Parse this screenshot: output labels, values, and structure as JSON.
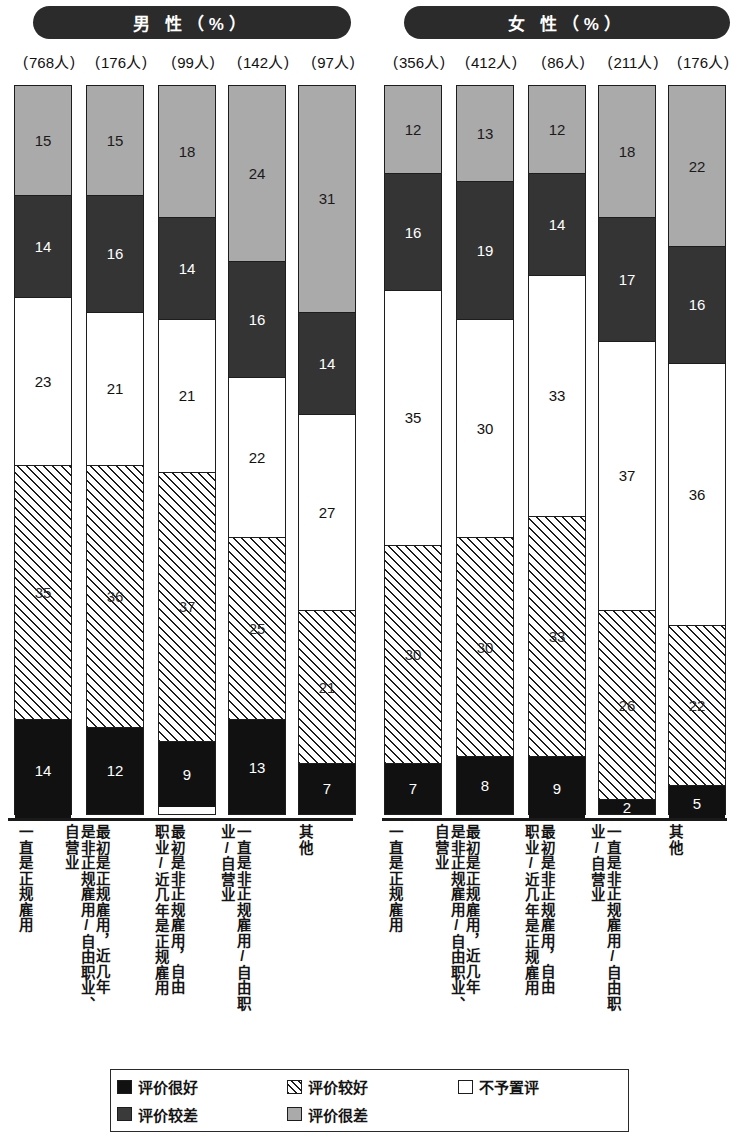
{
  "panels": [
    {
      "id": "male",
      "title": "男 性（%）"
    },
    {
      "id": "female",
      "title": "女 性（%）"
    }
  ],
  "legend": {
    "items": [
      {
        "key": "verygood",
        "label": "评价很好",
        "color": "#111111",
        "pattern": "solid-black"
      },
      {
        "key": "good",
        "label": "评价较好",
        "color": "#ffffff",
        "pattern": "diagonal-hatch"
      },
      {
        "key": "neutral",
        "label": "不予置评",
        "color": "#ffffff",
        "pattern": "solid-white"
      },
      {
        "key": "bad",
        "label": "评价较差",
        "color": "#343434",
        "pattern": "solid-dark-gray"
      },
      {
        "key": "verybad",
        "label": "评价很差",
        "color": "#aaaaaa",
        "pattern": "solid-light-gray"
      }
    ],
    "order_display": [
      "评价很好",
      "评价较好",
      "不予置评",
      "评价较差",
      "评价很差"
    ]
  },
  "categories": [
    "一直是正规雇用",
    "最初是正规雇用，近几年是非正规雇用/自由职业、自营业",
    "最初是非正规雇用，自由职业/近几年是正规雇用",
    "一直是非正规雇用/自由职业/自营业",
    "其他"
  ],
  "category_columns": [
    [
      "一直是正规雇用"
    ],
    [
      "最初是正规雇用，近几年",
      "是非正规雇用/自由职业、",
      "自营业"
    ],
    [
      "最初是非正规雇用，自由",
      "职业/近几年是正规雇用"
    ],
    [
      "一直是非正规雇用/自由职",
      "业/自营业"
    ],
    [
      "其他"
    ]
  ],
  "sample_sizes": {
    "male": [
      "768人",
      "176人",
      "99人",
      "142人",
      "97人"
    ],
    "female": [
      "356人",
      "412人",
      "86人",
      "211人",
      "176人"
    ]
  },
  "chart_data": {
    "type": "bar",
    "subtype": "stacked-100-percent",
    "xlabel": "",
    "ylabel": "%",
    "ylim": [
      0,
      100
    ],
    "grid": false,
    "legend_position": "bottom",
    "stack_order_bottom_to_top": [
      "评价很好",
      "评价较好",
      "不予置评",
      "评价较差",
      "评价很差"
    ],
    "categories": [
      "一直是正规雇用",
      "最初是正规雇用，近几年是非正规雇用/自由职业、自营业",
      "最初是非正规雇用，自由职业/近几年是正规雇用",
      "一直是非正规雇用/自由职业/自营业",
      "其他"
    ],
    "panels": [
      {
        "name": "男 性（%）",
        "sample_sizes": [
          768,
          176,
          99,
          142,
          97
        ],
        "series": [
          {
            "name": "评价很好",
            "values": [
              14,
              12,
              9,
              13,
              7
            ]
          },
          {
            "name": "评价较好",
            "values": [
              35,
              36,
              37,
              25,
              21
            ]
          },
          {
            "name": "不予置评",
            "values": [
              23,
              21,
              21,
              22,
              27
            ]
          },
          {
            "name": "评价较差",
            "values": [
              14,
              16,
              14,
              16,
              14
            ]
          },
          {
            "name": "评价很差",
            "values": [
              15,
              15,
              18,
              24,
              31
            ]
          }
        ]
      },
      {
        "name": "女 性（%）",
        "sample_sizes": [
          356,
          412,
          86,
          211,
          176
        ],
        "series": [
          {
            "name": "评价很好",
            "values": [
              7,
              8,
              9,
              2,
              5
            ]
          },
          {
            "name": "评价较好",
            "values": [
              30,
              30,
              33,
              26,
              22
            ]
          },
          {
            "name": "不予置评",
            "values": [
              35,
              30,
              33,
              37,
              36
            ]
          },
          {
            "name": "评价较差",
            "values": [
              16,
              19,
              14,
              17,
              16
            ]
          },
          {
            "name": "评价很差",
            "values": [
              12,
              13,
              12,
              18,
              22
            ]
          }
        ]
      }
    ]
  }
}
